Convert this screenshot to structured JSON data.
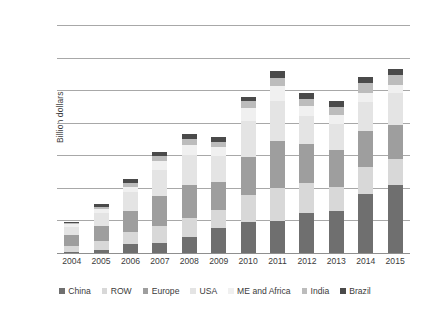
{
  "chart_data": {
    "type": "bar",
    "stacked": true,
    "title": "",
    "xlabel": "",
    "ylabel": "Billion dollars",
    "ylim": [
      0,
      350
    ],
    "ytick_step": 50,
    "yticks": [
      0,
      50,
      100,
      150,
      200,
      250,
      300,
      350
    ],
    "grid": true,
    "legend_position": "bottom",
    "categories": [
      "2004",
      "2005",
      "2006",
      "2007",
      "2008",
      "2009",
      "2010",
      "2011",
      "2012",
      "2013",
      "2014",
      "2015"
    ],
    "series": [
      {
        "name": "China",
        "color": "#6f6f6f",
        "values": [
          2,
          5,
          14,
          15,
          25,
          39,
          48,
          49,
          62,
          64,
          91,
          105
        ]
      },
      {
        "name": "ROW",
        "color": "#d8d8d8",
        "values": [
          9,
          13,
          18,
          27,
          29,
          27,
          41,
          51,
          45,
          38,
          41,
          40
        ]
      },
      {
        "name": "Europe",
        "color": "#9e9e9e",
        "values": [
          17,
          24,
          33,
          46,
          51,
          43,
          59,
          72,
          60,
          56,
          55,
          52
        ]
      },
      {
        "name": "USA",
        "color": "#e4e4e4",
        "values": [
          12,
          20,
          28,
          40,
          45,
          40,
          55,
          62,
          44,
          40,
          45,
          48
        ]
      },
      {
        "name": "ME and Africa",
        "color": "#f0f0f0",
        "values": [
          4,
          6,
          9,
          14,
          16,
          14,
          19,
          22,
          15,
          14,
          14,
          13
        ]
      },
      {
        "name": "India",
        "color": "#bcbcbc",
        "values": [
          2,
          3,
          5,
          7,
          9,
          8,
          11,
          13,
          10,
          12,
          15,
          15
        ]
      },
      {
        "name": "Brazil",
        "color": "#4a4a4a",
        "values": [
          2,
          4,
          6,
          6,
          8,
          7,
          7,
          11,
          10,
          9,
          10,
          10
        ]
      }
    ],
    "totals": [
      48,
      75,
      113,
      155,
      183,
      178,
      240,
      280,
      246,
      233,
      271,
      283
    ]
  },
  "legend": {
    "items": [
      {
        "label": "China"
      },
      {
        "label": "ROW"
      },
      {
        "label": "Europe"
      },
      {
        "label": "USA"
      },
      {
        "label": "ME and Africa"
      },
      {
        "label": "India"
      },
      {
        "label": "Brazil"
      }
    ]
  }
}
